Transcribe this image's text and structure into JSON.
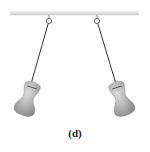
{
  "figure": {
    "caption": "(d)",
    "colors": {
      "bar": "#e2e2e2",
      "bar_edge": "#c8c8c8",
      "string": "#333333",
      "bob_fill": "#b0b0b0",
      "bob_highlight": "#d8d8d8",
      "bob_shadow": "#8a8a8a",
      "pivot": "#555555"
    },
    "pendulums": [
      {
        "label": "left-pendulum",
        "pivot": [
          49,
          21
        ],
        "bob_top": [
          31,
          84
        ]
      },
      {
        "label": "right-pendulum",
        "pivot": [
          97,
          21
        ],
        "bob_top": [
          116,
          84
        ]
      }
    ]
  }
}
